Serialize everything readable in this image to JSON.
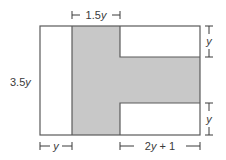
{
  "diagram": {
    "type": "geometry-figure",
    "colors": {
      "outline": "#5a5a5a",
      "shaded_fill": "#c8c8c8",
      "background": "#ffffff",
      "label": "#3a3a3a"
    },
    "labels": {
      "top_width": {
        "num": "1.5",
        "var": "y"
      },
      "left_height": {
        "num": "3.5",
        "var": "y"
      },
      "right_top": {
        "var": "y"
      },
      "right_bottom": {
        "var": "y"
      },
      "bottom_left": {
        "var": "y"
      },
      "bottom_right": {
        "pre": "2",
        "var": "y",
        "post": " + 1"
      }
    }
  }
}
